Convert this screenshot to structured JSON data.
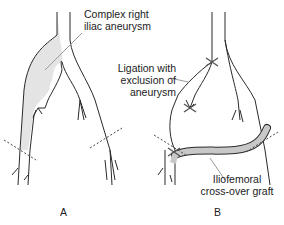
{
  "panels": [
    {
      "id": "A",
      "label": "A"
    },
    {
      "id": "B",
      "label": "B"
    }
  ],
  "annotations": {
    "aneurysm_line1": "Complex right",
    "aneurysm_line2": "iliac aneurysm",
    "ligation_line1": "Ligation with",
    "ligation_line2": "exclusion of",
    "ligation_line3": "aneurysm",
    "graft_line1": "Iliofemoral",
    "graft_line2": "cross-over graft"
  },
  "colors": {
    "stroke": "#2a2a2a",
    "aneurysm_fill": "#e4e4e4",
    "graft_fill": "#c8c8c8",
    "leader": "#9a9a9a"
  }
}
